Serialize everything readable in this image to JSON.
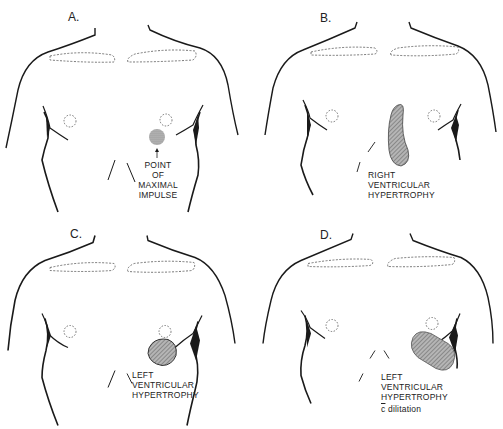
{
  "figure": {
    "panels": [
      {
        "id": "A",
        "label": "A.",
        "caption_lines": [
          "POINT",
          "OF",
          "MAXIMAL",
          "IMPULSE"
        ],
        "finding": "point of maximal impulse",
        "marker": "arrow"
      },
      {
        "id": "B",
        "label": "B.",
        "caption_lines": [
          "RIGHT",
          "VENTRICULAR",
          "HYPERTROPHY"
        ],
        "finding": "right ventricular hypertrophy"
      },
      {
        "id": "C",
        "label": "C.",
        "caption_lines": [
          "LEFT",
          "VENTRICULAR",
          "HYPERTROPHY"
        ],
        "finding": "left ventricular hypertrophy"
      },
      {
        "id": "D",
        "label": "D.",
        "caption_lines": [
          "LEFT",
          "VENTRICULAR",
          "HYPERTROPHY"
        ],
        "caption_extra_prefix": "c",
        "caption_extra_suffix": " dilitation",
        "finding": "left ventricular hypertrophy with dilatation"
      }
    ],
    "colors": {
      "line": "#1a1a1a",
      "dashed": "#555555",
      "shading": "#9a9a9a",
      "background": "#ffffff"
    }
  }
}
